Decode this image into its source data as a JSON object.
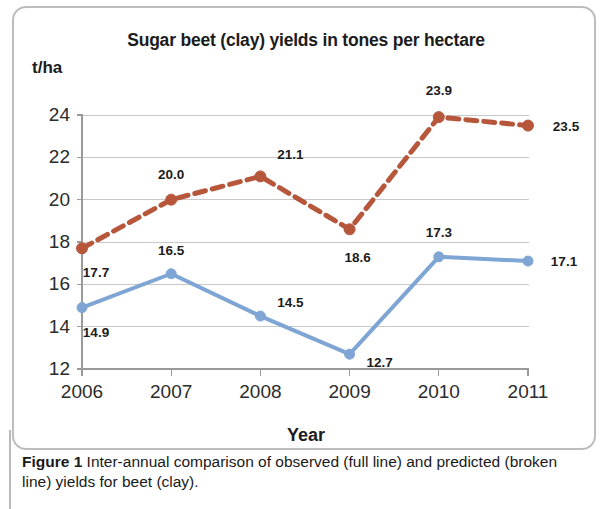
{
  "figure": {
    "caption_label": "Figure 1",
    "caption_text": " Inter-annual comparison of observed (full line) and predicted (broken line) yields for beet (clay)."
  },
  "chart_data": {
    "type": "line",
    "title": "Sugar beet (clay) yields in tones per hectare",
    "xlabel": "Year",
    "ylabel": "t/ha",
    "categories": [
      "2006",
      "2007",
      "2008",
      "2009",
      "2010",
      "2011"
    ],
    "ylim": [
      12,
      24
    ],
    "yticks": [
      12,
      14,
      16,
      18,
      20,
      22,
      24
    ],
    "ytick_labels": [
      "12",
      "14",
      "16",
      "18",
      "20",
      "22",
      "24"
    ],
    "grid": true,
    "legend": "none",
    "series": [
      {
        "name": "observed",
        "style": "full line",
        "color": "#7ea5d4",
        "marker": "circle",
        "values": [
          14.9,
          16.5,
          14.5,
          12.7,
          17.3,
          17.1
        ],
        "labels": [
          "14.9",
          "16.5",
          "14.5",
          "12.7",
          "17.3",
          "17.1"
        ]
      },
      {
        "name": "predicted",
        "style": "broken line",
        "color": "#b6573c",
        "marker": "circle",
        "values": [
          17.7,
          20.0,
          21.1,
          18.6,
          23.9,
          23.5
        ],
        "labels": [
          "17.7",
          "20.0",
          "21.1",
          "18.6",
          "23.9",
          "23.5"
        ]
      }
    ]
  },
  "colors": {
    "observed": "#7ea5d4",
    "predicted": "#b6573c",
    "grid": "#c9c9c9",
    "axis": "#9a9a9a",
    "frame": "#bdbdbd"
  }
}
